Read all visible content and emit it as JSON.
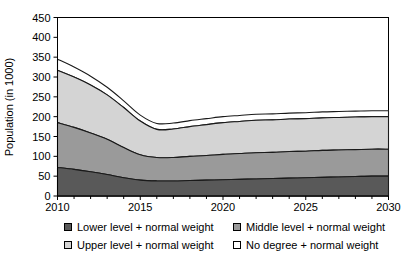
{
  "chart_data": {
    "type": "area",
    "stacked": true,
    "title": "",
    "subtitle": "",
    "xlabel": "",
    "ylabel": "Population (in 1000)",
    "xlim": [
      2010,
      2030
    ],
    "ylim": [
      0,
      450
    ],
    "ytick_step": 50,
    "yticks": [
      0,
      50,
      100,
      150,
      200,
      250,
      300,
      350,
      400,
      450
    ],
    "ytick_labels": [
      "0",
      "50",
      "100",
      "150",
      "200",
      "250",
      "300",
      "350",
      "400",
      "450"
    ],
    "xticks": [
      2010,
      2015,
      2020,
      2025,
      2030
    ],
    "xtick_labels": [
      "2010",
      "2015",
      "2020",
      "2025",
      "2030"
    ],
    "x_minor_ticks": [
      2011,
      2012,
      2013,
      2014,
      2016,
      2017,
      2018,
      2019,
      2021,
      2022,
      2023,
      2024,
      2026,
      2027,
      2028,
      2029
    ],
    "grid": false,
    "legend_position": "bottom",
    "x": [
      2010,
      2011,
      2012,
      2013,
      2014,
      2015,
      2016,
      2017,
      2018,
      2019,
      2020,
      2021,
      2022,
      2023,
      2024,
      2025,
      2026,
      2027,
      2028,
      2029,
      2030
    ],
    "series": [
      {
        "name": "Lower level + normal weight",
        "color": "#595959",
        "values": [
          72,
          67,
          61,
          54,
          46,
          40,
          38,
          38,
          39,
          40,
          41,
          42,
          43,
          44,
          45,
          46,
          47,
          48,
          49,
          50,
          50
        ]
      },
      {
        "name": "Middle level + normal weight",
        "color": "#9a9a9a",
        "values": [
          113,
          106,
          98,
          89,
          76,
          64,
          59,
          59,
          61,
          62,
          64,
          65,
          66,
          66,
          67,
          67,
          68,
          68,
          68,
          68,
          68
        ]
      },
      {
        "name": "Upper level + normal weight",
        "color": "#d4d4d4",
        "values": [
          132,
          127,
          121,
          112,
          101,
          85,
          71,
          72,
          75,
          78,
          80,
          81,
          82,
          82,
          82,
          82,
          82,
          82,
          82,
          82,
          82
        ]
      },
      {
        "name": "No degree + normal weight",
        "color": "#ffffff",
        "values": [
          28,
          25,
          22,
          19,
          17,
          15,
          15,
          15,
          15,
          15,
          15,
          15,
          15,
          15,
          15,
          15,
          15,
          15,
          15,
          15,
          15
        ]
      }
    ],
    "cumulative_totals": [
      345,
      325,
      302,
      274,
      240,
      204,
      183,
      184,
      190,
      195,
      200,
      203,
      206,
      207,
      209,
      210,
      212,
      213,
      214,
      215,
      215
    ],
    "annotations": []
  },
  "legend": {
    "columns": [
      {
        "entries": [
          {
            "label": "Lower level + normal weight",
            "color": "#595959"
          },
          {
            "label": "Upper level + normal weight",
            "color": "#d4d4d4"
          }
        ]
      },
      {
        "entries": [
          {
            "label": "Middle level + normal weight",
            "color": "#9a9a9a"
          },
          {
            "label": "No degree + normal weight",
            "color": "#ffffff"
          }
        ]
      }
    ]
  }
}
